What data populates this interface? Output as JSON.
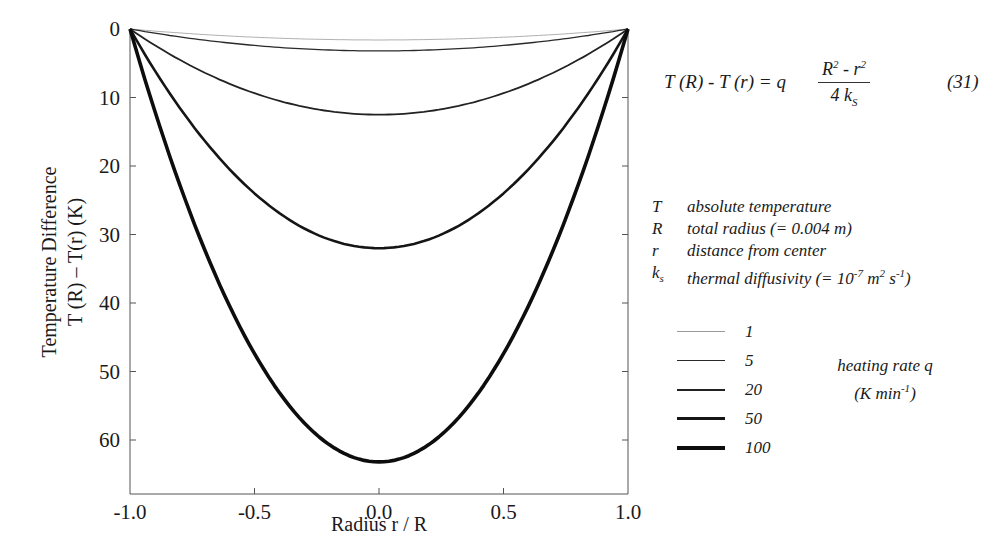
{
  "chart_data": {
    "type": "line",
    "title": "",
    "xlabel": "Radius r / R",
    "ylabel_line1": "Temperature Difference",
    "ylabel_line2": "T (R) – T(r)   (K)",
    "xlim": [
      -1.0,
      1.0
    ],
    "ylim": [
      65,
      0
    ],
    "y_inverted": true,
    "grid": false,
    "x_ticks": [
      "-1.0",
      "-0.5",
      "0.0",
      "0.5",
      "1.0"
    ],
    "x_tick_values": [
      -1.0,
      -0.5,
      0.0,
      0.5,
      1.0
    ],
    "y_ticks": [
      "0",
      "10",
      "20",
      "30",
      "40",
      "50",
      "60"
    ],
    "y_tick_values": [
      0,
      10,
      20,
      30,
      40,
      50,
      60
    ],
    "x": [
      -1.0,
      -0.75,
      -0.5,
      -0.25,
      0.0,
      0.25,
      0.5,
      0.75,
      1.0
    ],
    "series": [
      {
        "name": "1",
        "line_width": 0.8,
        "color": "#9a9a9a",
        "peak": 1.6,
        "values": [
          0,
          0.7,
          1.2,
          1.5,
          1.6,
          1.5,
          1.2,
          0.7,
          0
        ]
      },
      {
        "name": "5",
        "line_width": 1.3,
        "color": "#2a2a2a",
        "peak": 3.2,
        "values": [
          0,
          1.4,
          2.4,
          3.0,
          3.2,
          3.0,
          2.4,
          1.4,
          0
        ]
      },
      {
        "name": "20",
        "line_width": 1.8,
        "color": "#222222",
        "peak": 12.5,
        "values": [
          0,
          5.5,
          9.4,
          11.7,
          12.5,
          11.7,
          9.4,
          5.5,
          0
        ]
      },
      {
        "name": "50",
        "line_width": 2.6,
        "color": "#151515",
        "peak": 32,
        "values": [
          0,
          14.0,
          24.0,
          30.0,
          32,
          30.0,
          24.0,
          14.0,
          0
        ]
      },
      {
        "name": "100",
        "line_width": 3.6,
        "color": "#0d0d0d",
        "peak": 63.2,
        "values": [
          0,
          27.7,
          47.4,
          59.3,
          63.2,
          59.3,
          47.4,
          27.7,
          0
        ]
      }
    ],
    "legend": {
      "position": "right",
      "title_line1": "heating rate q",
      "title_line2": "(K min",
      "title_sup": "-1",
      "title_end": ")",
      "entries": [
        "1",
        "5",
        "20",
        "50",
        "100"
      ]
    },
    "annotations": {
      "equation": {
        "lhs": "T (R)  -  T (r)  =  q",
        "numerator_R": "R",
        "numerator_sup1": "2",
        "numerator_mid": " - r",
        "numerator_sup2": "2",
        "denominator": "4 k",
        "denominator_sub": "S",
        "number": "(31)"
      },
      "symbols": [
        {
          "sym": "T",
          "sub": "",
          "desc": "absolute temperature",
          "sup_parts": []
        },
        {
          "sym": "R",
          "sub": "",
          "desc": "total radius  (= 0.004 m)",
          "sup_parts": []
        },
        {
          "sym": "r",
          "sub": "",
          "desc": "distance from center",
          "sup_parts": []
        },
        {
          "sym": "k",
          "sub": "s",
          "desc": "thermal diffusivity (= 10",
          "sup_parts": [
            "-7",
            " m",
            "2",
            " s",
            "-1",
            ")"
          ]
        }
      ]
    }
  }
}
